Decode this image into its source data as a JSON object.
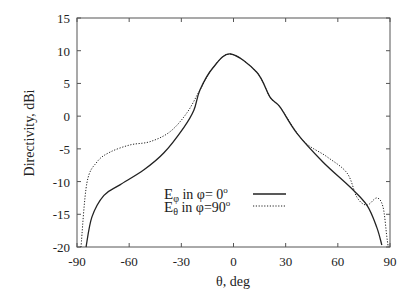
{
  "chart_data": {
    "type": "line",
    "title": "",
    "xlabel": "θ, deg",
    "ylabel": "Directivity, dBi",
    "xlim": [
      -90,
      90
    ],
    "ylim": [
      -20,
      15
    ],
    "xticks": [
      -90,
      -60,
      -30,
      0,
      30,
      60,
      90
    ],
    "yticks": [
      -20,
      -15,
      -10,
      -5,
      0,
      5,
      10,
      15
    ],
    "grid": false,
    "legend_position": "lower center (inside)",
    "series": [
      {
        "name": "Eφ in φ= 0°",
        "style": "solid",
        "color": "#222222",
        "x": [
          -84.8,
          -81.4,
          -74.5,
          -65.3,
          -51.5,
          -40,
          -28.5,
          -22.8,
          -19.3,
          -11.8,
          -1.7,
          13.4,
          21,
          26.7,
          36.4,
          51.4,
          66.9,
          76.7,
          82.4,
          85.3
        ],
        "y": [
          -20,
          -15.4,
          -12.1,
          -10.5,
          -8.2,
          -5.6,
          -1.7,
          0.9,
          4.0,
          7.4,
          9.5,
          6.7,
          2.9,
          1.4,
          -2.6,
          -7.0,
          -10.8,
          -13.6,
          -17.0,
          -19.7
        ]
      },
      {
        "name": "Eθ in φ=90°",
        "style": "dotted",
        "color": "#222222",
        "x": [
          -87.7,
          -84.3,
          -78.5,
          -71,
          -59.5,
          -48,
          -36.6,
          -26.8,
          -19.3,
          -11.8,
          -1.7,
          13.4,
          21,
          26.7,
          39.9,
          53.7,
          65.3,
          71,
          76.7,
          82.4,
          86,
          88.2,
          89
        ],
        "y": [
          -20,
          -10.2,
          -7.0,
          -5.5,
          -4.4,
          -3.9,
          -2.4,
          0.5,
          4.0,
          7.4,
          9.5,
          6.7,
          2.9,
          1.4,
          -3.7,
          -6.2,
          -8.7,
          -12.4,
          -13.6,
          -12.5,
          -13.9,
          -18.5,
          -20
        ]
      }
    ]
  },
  "labels": {
    "legend_row1": {
      "e": "E",
      "sub": "φ",
      "text": " in φ=  0",
      "sup": "o"
    },
    "legend_row2": {
      "e": "E",
      "sub": "θ",
      "text": " in φ=90",
      "sup": "o"
    }
  }
}
